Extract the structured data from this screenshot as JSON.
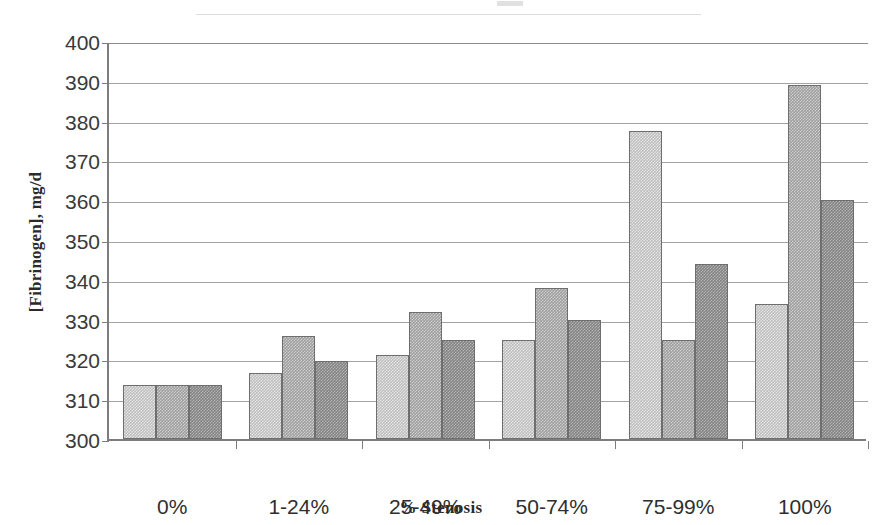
{
  "chart_data": {
    "type": "bar",
    "title": "",
    "xlabel": "% Stenosis",
    "ylabel": "[Fibrinogen], mg/d",
    "categories": [
      "0%",
      "1-24%",
      "25-49%",
      "50-74%",
      "75-99%",
      "100%"
    ],
    "series": [
      {
        "name": "series-1",
        "values": [
          313.5,
          316.5,
          321,
          325,
          377.5,
          334
        ]
      },
      {
        "name": "series-2",
        "values": [
          313.5,
          326,
          332,
          338,
          325,
          389
        ]
      },
      {
        "name": "series-3",
        "values": [
          313.5,
          319.5,
          325,
          330,
          344,
          360
        ]
      }
    ],
    "ylim": [
      300,
      400
    ],
    "ytick_labels": [
      "400",
      "390",
      "380",
      "370",
      "360",
      "350",
      "340",
      "330",
      "320",
      "310",
      "300"
    ],
    "ytick_values": [
      400,
      390,
      380,
      370,
      360,
      350,
      340,
      330,
      320,
      310,
      300
    ],
    "grid": true,
    "legend": "none",
    "series_colors": [
      "#bfbfbf",
      "#a0a0a0",
      "#848484"
    ],
    "axis_color": "#7d7d7d",
    "gridline_color": "#a3a3a3"
  }
}
